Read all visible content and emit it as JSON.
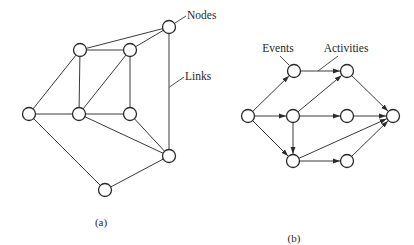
{
  "figure_a": {
    "caption": "(a)",
    "labels": {
      "nodes": "Nodes",
      "links": "Links"
    },
    "node_radius": 6.5,
    "nodes": [
      {
        "id": "n1",
        "x": 169,
        "y": 27
      },
      {
        "id": "n2",
        "x": 80,
        "y": 50
      },
      {
        "id": "n3",
        "x": 130,
        "y": 50
      },
      {
        "id": "n4",
        "x": 29,
        "y": 114
      },
      {
        "id": "n5",
        "x": 79,
        "y": 114
      },
      {
        "id": "n6",
        "x": 130,
        "y": 114
      },
      {
        "id": "n7",
        "x": 169,
        "y": 156
      },
      {
        "id": "n8",
        "x": 105,
        "y": 190
      }
    ],
    "links": [
      [
        "n2",
        "n1"
      ],
      [
        "n3",
        "n1"
      ],
      [
        "n1",
        "n7"
      ],
      [
        "n2",
        "n3"
      ],
      [
        "n2",
        "n5"
      ],
      [
        "n2",
        "n4"
      ],
      [
        "n3",
        "n5"
      ],
      [
        "n3",
        "n6"
      ],
      [
        "n4",
        "n5"
      ],
      [
        "n5",
        "n6"
      ],
      [
        "n5",
        "n7"
      ],
      [
        "n6",
        "n7"
      ],
      [
        "n4",
        "n8"
      ],
      [
        "n8",
        "n7"
      ]
    ]
  },
  "figure_b": {
    "caption": "(b)",
    "labels": {
      "events": "Events",
      "activities": "Activities"
    },
    "node_radius": 6.5,
    "nodes": [
      {
        "id": "e1",
        "x": 248,
        "y": 116
      },
      {
        "id": "e2",
        "x": 294,
        "y": 71
      },
      {
        "id": "e3",
        "x": 293,
        "y": 116
      },
      {
        "id": "e4",
        "x": 293,
        "y": 161
      },
      {
        "id": "e5",
        "x": 347,
        "y": 71
      },
      {
        "id": "e6",
        "x": 347,
        "y": 116
      },
      {
        "id": "e7",
        "x": 347,
        "y": 161
      },
      {
        "id": "e8",
        "x": 393,
        "y": 116
      }
    ],
    "activities": [
      [
        "e1",
        "e2"
      ],
      [
        "e1",
        "e3"
      ],
      [
        "e1",
        "e4"
      ],
      [
        "e2",
        "e5"
      ],
      [
        "e3",
        "e5"
      ],
      [
        "e3",
        "e6"
      ],
      [
        "e3",
        "e4"
      ],
      [
        "e4",
        "e8"
      ],
      [
        "e4",
        "e7"
      ],
      [
        "e5",
        "e8"
      ],
      [
        "e6",
        "e8"
      ],
      [
        "e7",
        "e8"
      ]
    ]
  },
  "colors": {
    "line": "#3a3a3a",
    "node_stroke": "#2a2a2a",
    "node_fill": "#ffffff",
    "text": "#1f1f1f",
    "background": "#ffffff"
  }
}
